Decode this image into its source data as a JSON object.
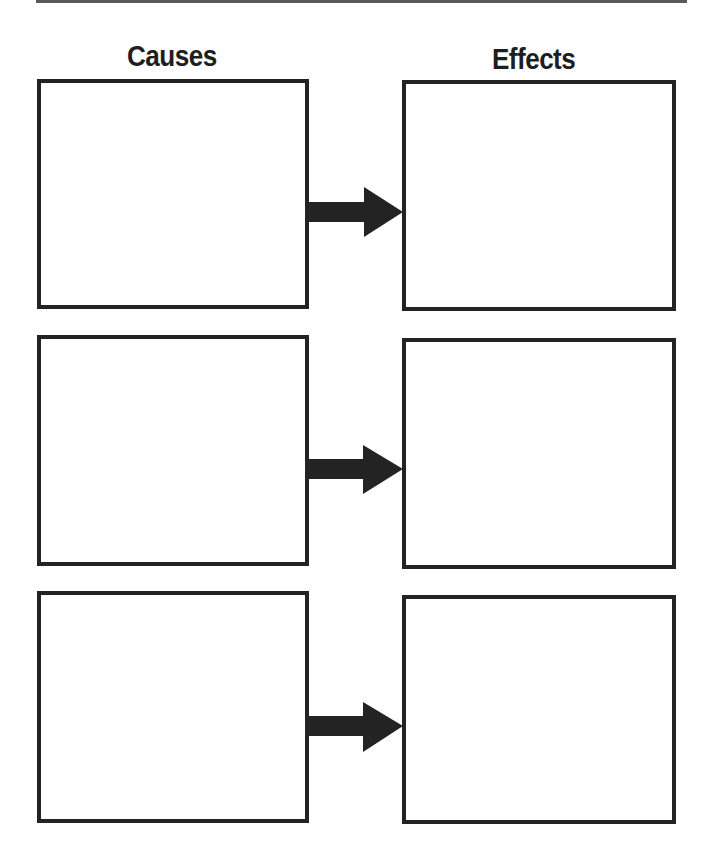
{
  "worksheet": {
    "headings": {
      "causes": "Causes",
      "effects": "Effects"
    },
    "rows": [
      {
        "cause_text": "",
        "effect_text": "",
        "arrow_icon": "right-arrow"
      },
      {
        "cause_text": "",
        "effect_text": "",
        "arrow_icon": "right-arrow"
      },
      {
        "cause_text": "",
        "effect_text": "",
        "arrow_icon": "right-arrow"
      }
    ],
    "colors": {
      "ink": "#232323",
      "rule": "#5a5a5a",
      "background": "#ffffff"
    }
  }
}
